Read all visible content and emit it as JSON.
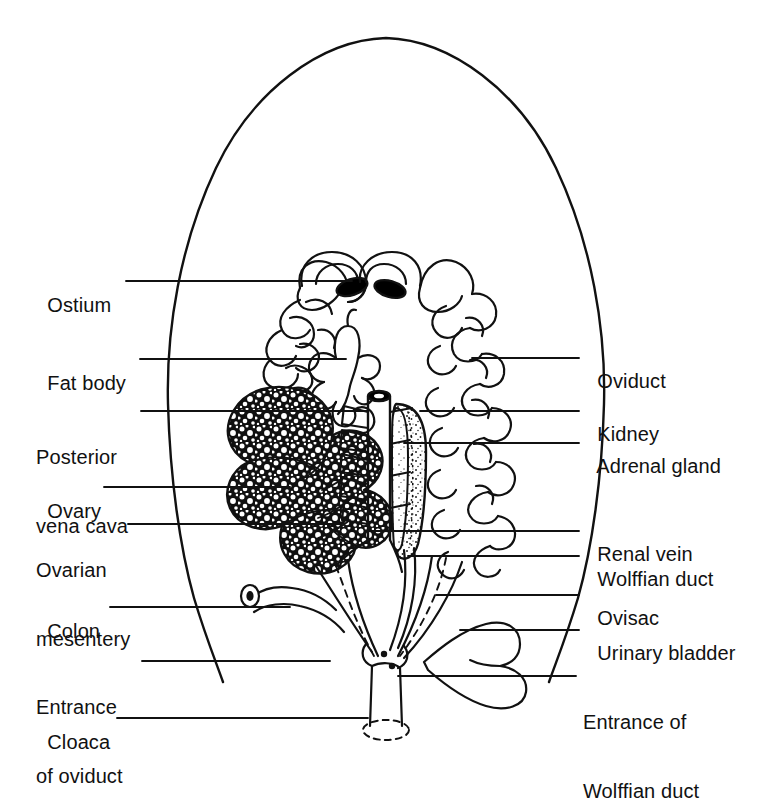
{
  "figure": {
    "ink_color": "#111111",
    "background_color": "#ffffff"
  },
  "labels_left": [
    {
      "id": "ostium",
      "text": "Ostium",
      "text2": ""
    },
    {
      "id": "fat-body",
      "text": "Fat body",
      "text2": ""
    },
    {
      "id": "posterior-vena-cava",
      "text": "Posterior",
      "text2": "vena cava"
    },
    {
      "id": "ovary",
      "text": "Ovary",
      "text2": ""
    },
    {
      "id": "ovarian-mesentery",
      "text": "Ovarian",
      "text2": "mesentery"
    },
    {
      "id": "colon",
      "text": "Colon",
      "text2": ""
    },
    {
      "id": "entrance-of-oviduct",
      "text": "Entrance",
      "text2": "of oviduct"
    },
    {
      "id": "cloaca",
      "text": "Cloaca",
      "text2": ""
    }
  ],
  "labels_right": [
    {
      "id": "oviduct",
      "text": "Oviduct",
      "text2": ""
    },
    {
      "id": "kidney",
      "text": "Kidney",
      "text2": ""
    },
    {
      "id": "adrenal-gland",
      "text": "Adrenal gland",
      "text2": ""
    },
    {
      "id": "renal-vein",
      "text": "Renal vein",
      "text2": ""
    },
    {
      "id": "wolffian-duct",
      "text": "Wolffian duct",
      "text2": ""
    },
    {
      "id": "ovisac",
      "text": "Ovisac",
      "text2": ""
    },
    {
      "id": "urinary-bladder",
      "text": "Urinary bladder",
      "text2": ""
    },
    {
      "id": "entrance-of-wolffian-duct",
      "text": "Entrance of",
      "text2": "Wolffian duct"
    }
  ],
  "structures": [
    "body-outline",
    "ostium-left",
    "ostium-right",
    "oviduct-left",
    "oviduct-right",
    "fat-body",
    "ovary",
    "ovarian-mesentery",
    "posterior-vena-cava",
    "kidney",
    "adrenal-gland",
    "renal-vein",
    "wolffian-duct",
    "ovisac",
    "colon",
    "urinary-bladder",
    "cloaca"
  ]
}
